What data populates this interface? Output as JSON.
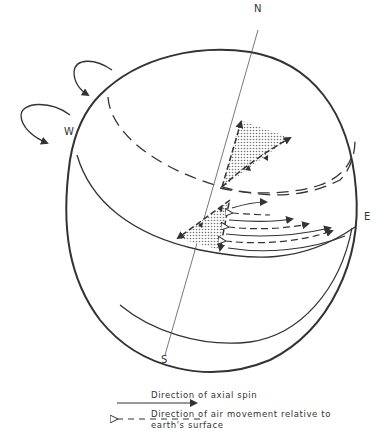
{
  "diagram": {
    "title": "",
    "labels": {
      "north": "N",
      "south": "S",
      "west": "W",
      "east": "E"
    },
    "legend": {
      "solid_arrow_label": "Direction of axial spin",
      "dashed_arrow_label_line1": "Direction of air movement relative to",
      "dashed_arrow_label_line2": "earth's surface"
    },
    "colors": {
      "line": "#333333",
      "stipple": "#9a9a9a",
      "background": "#ffffff"
    }
  }
}
